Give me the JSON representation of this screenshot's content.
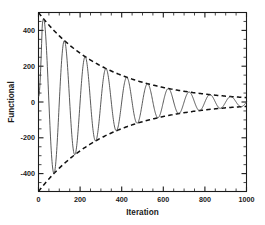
{
  "chart_data": {
    "type": "line",
    "title": "",
    "subtitle": "",
    "xlabel": "Iteration",
    "ylabel": "Functional",
    "xlim": [
      0,
      1000
    ],
    "ylim": [
      -500,
      500
    ],
    "grid": false,
    "legend": null,
    "x_ticks": [
      0,
      200,
      400,
      600,
      800,
      1000
    ],
    "x_tick_labels": [
      "0",
      "200",
      "400",
      "600",
      "800",
      "1000"
    ],
    "x_minor_step": 50,
    "y_ticks": [
      -400,
      -200,
      0,
      200,
      400
    ],
    "y_tick_labels": [
      "-400",
      "-200",
      "0",
      "200",
      "400"
    ],
    "y_minor_step": 50,
    "background_color": "#ffffff",
    "axis_color": "#1a1a1a",
    "series": [
      {
        "name": "functional-oscillation",
        "style": "solid",
        "color": "#3c3c3c",
        "description": "Damped oscillatory convergence of the functional, period about 100 iterations, exponential decay with decay constant about 320 iterations.",
        "model": {
          "form": "A0*exp(-x/tau)*sin(2*pi*x/period + phase) + offset",
          "A0": 500,
          "tau": 330,
          "period": 100,
          "phase_deg": 0,
          "offset": 0,
          "start_value": 30
        },
        "sampled_points": [
          [
            0,
            30
          ],
          [
            10,
            250
          ],
          [
            25,
            460
          ],
          [
            40,
            300
          ],
          [
            55,
            0
          ],
          [
            70,
            -330
          ],
          [
            80,
            -380
          ],
          [
            95,
            -150
          ],
          [
            110,
            180
          ],
          [
            122,
            300
          ],
          [
            135,
            200
          ],
          [
            150,
            -60
          ],
          [
            168,
            -270
          ],
          [
            180,
            -230
          ],
          [
            195,
            40
          ],
          [
            212,
            200
          ],
          [
            225,
            170
          ],
          [
            240,
            -30
          ],
          [
            258,
            -180
          ],
          [
            272,
            -150
          ],
          [
            288,
            30
          ],
          [
            305,
            140
          ],
          [
            318,
            120
          ],
          [
            332,
            -20
          ],
          [
            348,
            -125
          ],
          [
            362,
            -100
          ],
          [
            378,
            25
          ],
          [
            395,
            100
          ],
          [
            408,
            85
          ],
          [
            422,
            -15
          ],
          [
            438,
            -90
          ],
          [
            452,
            -70
          ],
          [
            468,
            20
          ],
          [
            485,
            72
          ],
          [
            498,
            60
          ],
          [
            512,
            -12
          ],
          [
            528,
            -62
          ],
          [
            542,
            -50
          ],
          [
            558,
            15
          ],
          [
            575,
            52
          ],
          [
            588,
            42
          ],
          [
            602,
            -10
          ],
          [
            618,
            -45
          ],
          [
            632,
            -36
          ],
          [
            648,
            12
          ],
          [
            665,
            38
          ],
          [
            678,
            30
          ],
          [
            692,
            -8
          ],
          [
            708,
            -32
          ],
          [
            722,
            -26
          ],
          [
            738,
            9
          ],
          [
            755,
            27
          ],
          [
            768,
            22
          ],
          [
            782,
            -6
          ],
          [
            798,
            -23
          ],
          [
            812,
            -18
          ],
          [
            828,
            7
          ],
          [
            845,
            19
          ],
          [
            858,
            15
          ],
          [
            872,
            -5
          ],
          [
            888,
            -16
          ],
          [
            902,
            -13
          ],
          [
            918,
            5
          ],
          [
            935,
            13
          ],
          [
            948,
            10
          ],
          [
            962,
            -3
          ],
          [
            978,
            -11
          ],
          [
            990,
            -6
          ],
          [
            1000,
            2
          ]
        ]
      },
      {
        "name": "upper-envelope",
        "style": "dashed",
        "color": "#111111",
        "description": "Upper exponential decay envelope +500*exp(-x/330)",
        "model": {
          "form": "A0*exp(-x/tau)",
          "A0": 500,
          "tau": 330
        },
        "sampled_points": [
          [
            0,
            500
          ],
          [
            25,
            462
          ],
          [
            50,
            430
          ],
          [
            100,
            370
          ],
          [
            150,
            318
          ],
          [
            200,
            273
          ],
          [
            250,
            235
          ],
          [
            300,
            202
          ],
          [
            350,
            174
          ],
          [
            400,
            149
          ],
          [
            450,
            128
          ],
          [
            500,
            110
          ],
          [
            550,
            95
          ],
          [
            600,
            81
          ],
          [
            650,
            70
          ],
          [
            700,
            60
          ],
          [
            750,
            52
          ],
          [
            800,
            44
          ],
          [
            850,
            38
          ],
          [
            900,
            33
          ],
          [
            950,
            28
          ],
          [
            1000,
            24
          ]
        ]
      },
      {
        "name": "lower-envelope",
        "style": "dashed",
        "color": "#111111",
        "description": "Lower exponential decay envelope -500*exp(-x/330)",
        "model": {
          "form": "-A0*exp(-x/tau)",
          "A0": 500,
          "tau": 330
        },
        "sampled_points": [
          [
            0,
            -495
          ],
          [
            25,
            -462
          ],
          [
            50,
            -430
          ],
          [
            100,
            -370
          ],
          [
            150,
            -318
          ],
          [
            200,
            -273
          ],
          [
            250,
            -235
          ],
          [
            300,
            -202
          ],
          [
            350,
            -174
          ],
          [
            400,
            -149
          ],
          [
            450,
            -128
          ],
          [
            500,
            -110
          ],
          [
            550,
            -95
          ],
          [
            600,
            -81
          ],
          [
            650,
            -70
          ],
          [
            700,
            -60
          ],
          [
            750,
            -52
          ],
          [
            800,
            -44
          ],
          [
            850,
            -38
          ],
          [
            900,
            -33
          ],
          [
            950,
            -28
          ],
          [
            1000,
            -24
          ]
        ]
      }
    ]
  }
}
